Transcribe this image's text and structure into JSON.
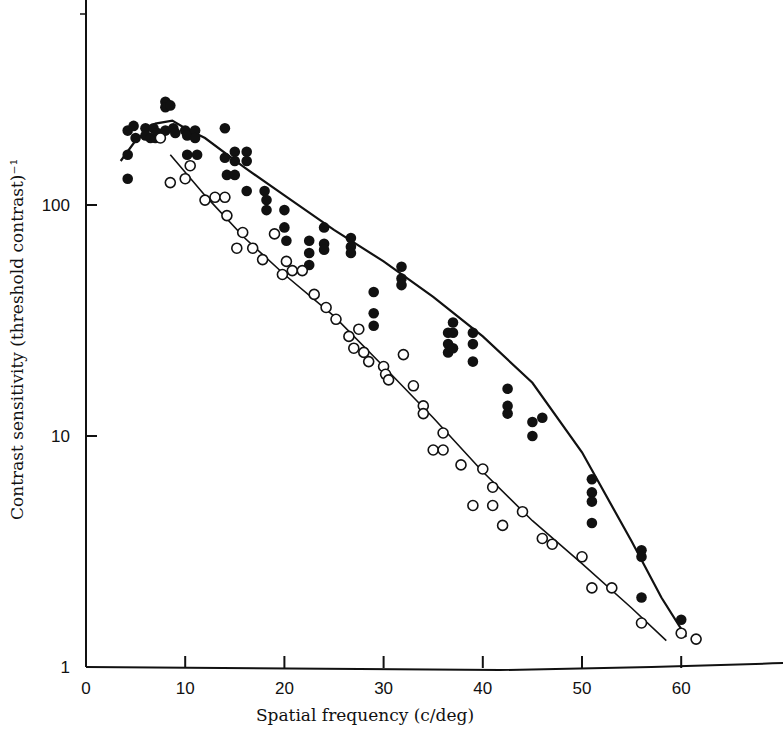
{
  "chart_data": {
    "type": "scatter",
    "title": "",
    "xlabel": "Spatial frequency (c/deg)",
    "ylabel": "Contrast sensitivity (threshold contrast)⁻¹",
    "xlim": [
      0,
      62
    ],
    "ylim": [
      1,
      770
    ],
    "yscale": "log",
    "x_ticks": [
      0,
      10,
      20,
      30,
      40,
      50,
      60
    ],
    "y_ticks": [
      1,
      10,
      100
    ],
    "grid": false,
    "legend": null,
    "series": [
      {
        "name": "filled circles",
        "marker": "filled-circle",
        "points": [
          [
            4.2,
            210
          ],
          [
            4.2,
            165
          ],
          [
            4.2,
            130
          ],
          [
            4.8,
            220
          ],
          [
            5.0,
            195
          ],
          [
            6.0,
            215
          ],
          [
            6.0,
            200
          ],
          [
            6.5,
            195
          ],
          [
            6.8,
            215
          ],
          [
            7.0,
            195
          ],
          [
            7.2,
            205
          ],
          [
            8.0,
            280
          ],
          [
            8.0,
            265
          ],
          [
            8.5,
            270
          ],
          [
            8.0,
            210
          ],
          [
            8.8,
            215
          ],
          [
            9.0,
            205
          ],
          [
            10.0,
            210
          ],
          [
            10.2,
            200
          ],
          [
            10.2,
            165
          ],
          [
            11.0,
            210
          ],
          [
            11.0,
            195
          ],
          [
            11.2,
            165
          ],
          [
            14.0,
            215
          ],
          [
            14.0,
            160
          ],
          [
            14.2,
            135
          ],
          [
            15.0,
            170
          ],
          [
            15.0,
            155
          ],
          [
            15.0,
            135
          ],
          [
            16.2,
            170
          ],
          [
            16.2,
            155
          ],
          [
            16.2,
            115
          ],
          [
            18.0,
            115
          ],
          [
            18.2,
            105
          ],
          [
            18.2,
            95
          ],
          [
            20.0,
            95
          ],
          [
            20.0,
            80
          ],
          [
            20.2,
            70
          ],
          [
            22.5,
            70
          ],
          [
            22.5,
            62
          ],
          [
            22.5,
            55
          ],
          [
            24.0,
            80
          ],
          [
            24.0,
            68
          ],
          [
            24.0,
            64
          ],
          [
            26.7,
            72
          ],
          [
            26.7,
            66
          ],
          [
            26.7,
            62
          ],
          [
            29.0,
            42
          ],
          [
            29.0,
            34
          ],
          [
            29.0,
            30
          ],
          [
            31.8,
            54
          ],
          [
            31.8,
            48
          ],
          [
            31.8,
            45
          ],
          [
            36.5,
            28
          ],
          [
            36.5,
            25
          ],
          [
            36.5,
            23
          ],
          [
            37.0,
            31
          ],
          [
            37.0,
            28
          ],
          [
            37.0,
            24
          ],
          [
            39.0,
            28
          ],
          [
            39.0,
            25
          ],
          [
            39.0,
            21
          ],
          [
            42.5,
            16
          ],
          [
            42.5,
            13.5
          ],
          [
            42.5,
            12.5
          ],
          [
            45.0,
            11.5
          ],
          [
            45.0,
            10
          ],
          [
            46.0,
            12
          ],
          [
            51.0,
            6.5
          ],
          [
            51.0,
            5.7
          ],
          [
            51.0,
            5.2
          ],
          [
            51.0,
            4.2
          ],
          [
            56.0,
            3.2
          ],
          [
            56.0,
            3.0
          ],
          [
            56.0,
            2.0
          ],
          [
            60.0,
            1.6
          ]
        ],
        "fit_curve": [
          [
            3.5,
            155
          ],
          [
            5,
            190
          ],
          [
            7,
            225
          ],
          [
            8.7,
            232
          ],
          [
            10,
            215
          ],
          [
            12,
            195
          ],
          [
            16,
            145
          ],
          [
            20,
            110
          ],
          [
            25,
            78
          ],
          [
            30,
            57
          ],
          [
            35,
            40
          ],
          [
            40,
            27
          ],
          [
            45,
            17
          ],
          [
            50,
            8.5
          ],
          [
            55,
            3.5
          ],
          [
            58,
            2.0
          ],
          [
            60.5,
            1.35
          ]
        ]
      },
      {
        "name": "open circles",
        "marker": "open-circle",
        "points": [
          [
            7.5,
            195
          ],
          [
            8.5,
            125
          ],
          [
            10.0,
            130
          ],
          [
            10.5,
            148
          ],
          [
            12.0,
            105
          ],
          [
            13.0,
            108
          ],
          [
            14.0,
            108
          ],
          [
            14.2,
            90
          ],
          [
            15.2,
            65
          ],
          [
            15.8,
            76
          ],
          [
            16.8,
            65
          ],
          [
            17.8,
            58
          ],
          [
            19.0,
            75
          ],
          [
            19.8,
            50
          ],
          [
            20.2,
            57
          ],
          [
            20.8,
            52
          ],
          [
            21.8,
            52
          ],
          [
            23.0,
            41
          ],
          [
            24.2,
            36
          ],
          [
            25.2,
            32
          ],
          [
            26.5,
            27
          ],
          [
            27.0,
            24
          ],
          [
            27.5,
            29
          ],
          [
            28.0,
            23
          ],
          [
            28.5,
            21
          ],
          [
            30.0,
            20
          ],
          [
            30.2,
            18.5
          ],
          [
            30.5,
            17.5
          ],
          [
            32.0,
            22.5
          ],
          [
            33.0,
            16.5
          ],
          [
            34.0,
            13.5
          ],
          [
            34.0,
            12.5
          ],
          [
            35.0,
            8.7
          ],
          [
            36.0,
            10.3
          ],
          [
            36.0,
            8.7
          ],
          [
            37.8,
            7.5
          ],
          [
            39.0,
            5.0
          ],
          [
            40.0,
            7.2
          ],
          [
            41.0,
            6.0
          ],
          [
            41.0,
            5.0
          ],
          [
            42.0,
            4.1
          ],
          [
            44.0,
            4.7
          ],
          [
            46.0,
            3.6
          ],
          [
            47.0,
            3.4
          ],
          [
            50.0,
            3.0
          ],
          [
            51.0,
            2.2
          ],
          [
            53.0,
            2.2
          ],
          [
            56.0,
            1.55
          ],
          [
            60.0,
            1.4
          ],
          [
            61.5,
            1.32
          ]
        ],
        "fit_curve": [
          [
            8.5,
            165
          ],
          [
            12,
            110
          ],
          [
            16,
            72
          ],
          [
            20,
            50
          ],
          [
            25,
            33
          ],
          [
            30,
            20
          ],
          [
            35,
            12
          ],
          [
            40,
            7
          ],
          [
            45,
            4.3
          ],
          [
            50,
            2.8
          ],
          [
            55,
            1.8
          ],
          [
            58.5,
            1.3
          ]
        ]
      }
    ]
  }
}
